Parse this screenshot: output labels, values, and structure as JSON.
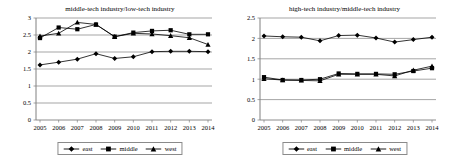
{
  "chart_data": [
    {
      "type": "line",
      "title": "middle-tech industry/low-tech industry",
      "xlabel": "",
      "ylabel": "",
      "x": [
        "2005",
        "2006",
        "2007",
        "2008",
        "2009",
        "2010",
        "2011",
        "2012",
        "2013",
        "2014"
      ],
      "categories": [
        "2005",
        "2006",
        "2007",
        "2008",
        "2009",
        "2010",
        "2011",
        "2012",
        "2013",
        "2014"
      ],
      "ylim": [
        0,
        3
      ],
      "yticks": [
        "0",
        "0.5",
        "1",
        "1.5",
        "2",
        "2.5",
        "3"
      ],
      "ytick_values": [
        0,
        0.5,
        1,
        1.5,
        2,
        2.5,
        3
      ],
      "grid": true,
      "legend_position": "bottom",
      "series": [
        {
          "name": "east",
          "marker": "diamond",
          "values": [
            1.62,
            1.7,
            1.79,
            1.95,
            1.81,
            1.86,
            2.01,
            2.02,
            2.02,
            2.01
          ]
        },
        {
          "name": "middle",
          "marker": "square",
          "values": [
            2.41,
            2.72,
            2.67,
            2.81,
            2.45,
            2.57,
            2.62,
            2.64,
            2.52,
            2.52
          ]
        },
        {
          "name": "west",
          "marker": "triangle",
          "values": [
            2.47,
            2.55,
            2.87,
            2.81,
            2.45,
            2.55,
            2.53,
            2.48,
            2.42,
            2.22
          ]
        }
      ]
    },
    {
      "type": "line",
      "title": "high-tech industry/middle-tech industry",
      "xlabel": "",
      "ylabel": "",
      "x": [
        "2005",
        "2006",
        "2007",
        "2008",
        "2009",
        "2010",
        "2011",
        "2012",
        "2013",
        "2014"
      ],
      "categories": [
        "2005",
        "2006",
        "2007",
        "2008",
        "2009",
        "2010",
        "2011",
        "2012",
        "2013",
        "2014"
      ],
      "ylim": [
        0,
        2.5
      ],
      "yticks": [
        "0",
        "0.5",
        "1",
        "1.5",
        "2",
        "2.5"
      ],
      "ytick_values": [
        0,
        0.5,
        1,
        1.5,
        2,
        2.5
      ],
      "grid": true,
      "legend_position": "bottom",
      "series": [
        {
          "name": "east",
          "marker": "diamond",
          "values": [
            2.06,
            2.04,
            2.03,
            1.94,
            2.07,
            2.08,
            2.01,
            1.91,
            1.97,
            2.03
          ]
        },
        {
          "name": "middle",
          "marker": "square",
          "values": [
            1.05,
            0.98,
            0.98,
            1.0,
            1.14,
            1.13,
            1.13,
            1.12,
            1.2,
            1.27
          ]
        },
        {
          "name": "west",
          "marker": "triangle",
          "values": [
            1.01,
            0.98,
            0.97,
            0.96,
            1.12,
            1.12,
            1.12,
            1.08,
            1.22,
            1.32
          ]
        }
      ]
    }
  ],
  "left_panel": {
    "title": "middle-tech industry/low-tech industry",
    "legend": [
      {
        "label": "east"
      },
      {
        "label": "middle"
      },
      {
        "label": "west"
      }
    ]
  },
  "right_panel": {
    "title": "high-tech industry/middle-tech industry",
    "legend": [
      {
        "label": "east"
      },
      {
        "label": "middle"
      },
      {
        "label": "west"
      }
    ]
  },
  "colors": {
    "series": "#000000",
    "gridline": "#808080",
    "axis": "#808080",
    "legend_border": "#8a8a8a",
    "background": "#ffffff"
  }
}
